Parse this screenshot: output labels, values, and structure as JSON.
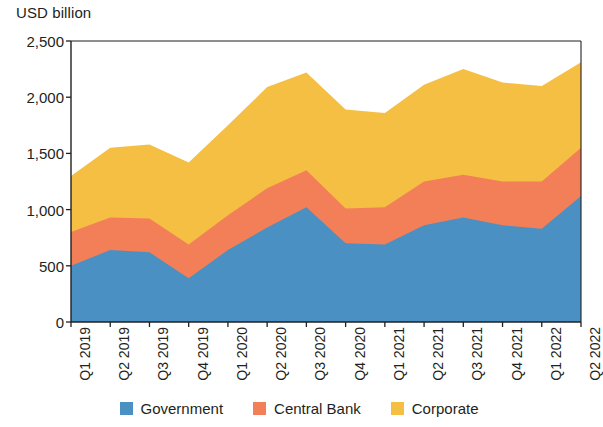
{
  "chart_data": {
    "type": "area",
    "stacked": true,
    "title": "",
    "subtitle": "",
    "xlabel": "",
    "ylabel": "USD billion",
    "ylim": [
      0,
      2500
    ],
    "ytick_labels": [
      "0",
      "500",
      "1,000",
      "1,500",
      "2,000",
      "2,500"
    ],
    "ytick_values": [
      0,
      500,
      1000,
      1500,
      2000,
      2500
    ],
    "grid": false,
    "legend_position": "bottom",
    "categories": [
      "Q1 2019",
      "Q2 2019",
      "Q3 2019",
      "Q4 2019",
      "Q1 2020",
      "Q2 2020",
      "Q3 2020",
      "Q4 2020",
      "Q1 2021",
      "Q2 2021",
      "Q3 2021",
      "Q4 2021",
      "Q1 2022",
      "Q2 2022"
    ],
    "series": [
      {
        "name": "Government",
        "color": "#4a90c2",
        "values": [
          500,
          640,
          620,
          390,
          640,
          840,
          1020,
          700,
          690,
          860,
          930,
          860,
          830,
          1120
        ]
      },
      {
        "name": "Central Bank",
        "color": "#f37f58",
        "values": [
          300,
          290,
          300,
          300,
          310,
          350,
          330,
          310,
          330,
          390,
          380,
          390,
          420,
          430
        ]
      },
      {
        "name": "Corporate",
        "color": "#f5bf44",
        "values": [
          500,
          620,
          660,
          730,
          800,
          900,
          870,
          880,
          840,
          860,
          940,
          880,
          850,
          760
        ]
      }
    ],
    "totals": [
      1300,
      1550,
      1580,
      1420,
      1750,
      2090,
      2220,
      1890,
      1860,
      2110,
      2250,
      2130,
      2100,
      2310
    ]
  },
  "legend": {
    "items": [
      {
        "label": "Government",
        "color": "#4a90c2"
      },
      {
        "label": "Central Bank",
        "color": "#f37f58"
      },
      {
        "label": "Corporate",
        "color": "#f5bf44"
      }
    ]
  },
  "axis": {
    "y_title": "USD billion"
  }
}
